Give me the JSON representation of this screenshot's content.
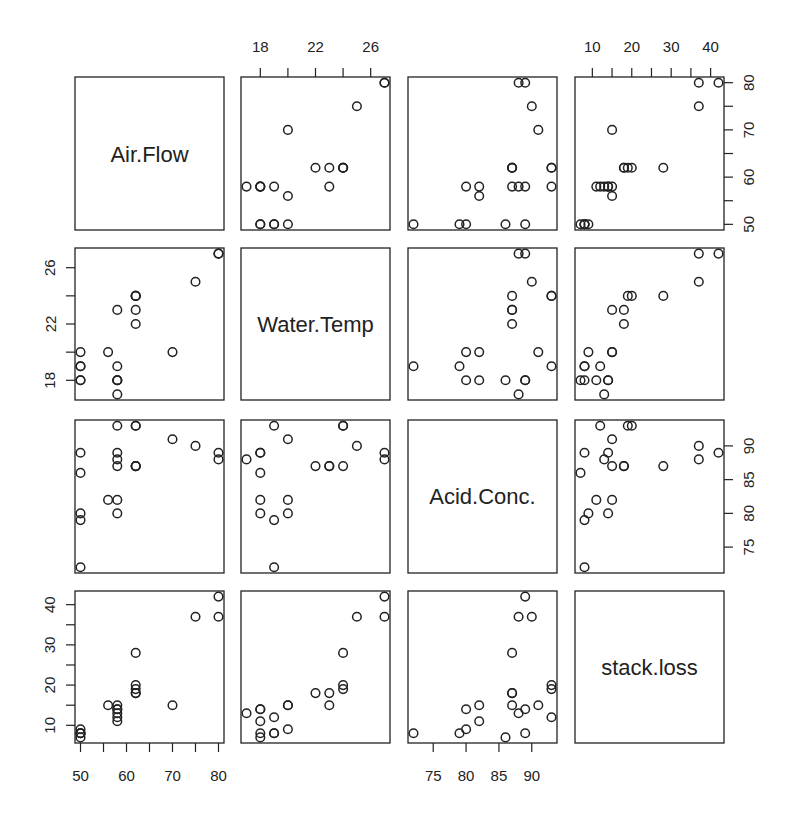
{
  "chart_data": {
    "type": "scatter",
    "subtype": "scatterplot-matrix",
    "title": "",
    "variables": [
      "Air.Flow",
      "Water.Temp",
      "Acid.Conc.",
      "stack.loss"
    ],
    "ranges": {
      "Air.Flow": [
        50,
        80
      ],
      "Water.Temp": [
        17,
        27
      ],
      "Acid.Conc.": [
        72,
        93
      ],
      "stack.loss": [
        7,
        42
      ]
    },
    "ticks": {
      "Air.Flow": {
        "major": [
          50,
          55,
          60,
          65,
          70,
          75,
          80
        ],
        "labels": [
          "50",
          "60",
          "70",
          "80"
        ],
        "label_values": [
          50,
          60,
          70,
          80
        ]
      },
      "Water.Temp": {
        "major": [
          18,
          20,
          22,
          24,
          26
        ],
        "labels": [
          "18",
          "22",
          "26"
        ],
        "label_values": [
          18,
          22,
          26
        ]
      },
      "Acid.Conc.": {
        "major": [
          75,
          80,
          85,
          90
        ],
        "labels": [
          "75",
          "80",
          "85",
          "90"
        ],
        "label_values": [
          75,
          80,
          85,
          90
        ]
      },
      "stack.loss": {
        "major": [
          10,
          15,
          20,
          25,
          30,
          35,
          40
        ],
        "labels": [
          "10",
          "20",
          "30",
          "40"
        ],
        "label_values": [
          10,
          20,
          30,
          40
        ]
      }
    },
    "axis_placement": {
      "top": [
        "Water.Temp",
        "stack.loss"
      ],
      "bottom": [
        "Air.Flow",
        "Acid.Conc."
      ],
      "left": [
        "Water.Temp",
        "stack.loss"
      ],
      "right": [
        "Air.Flow",
        "Acid.Conc."
      ]
    },
    "marker": "open-circle",
    "grid": false,
    "legend": null,
    "data": {
      "Air.Flow": [
        80,
        80,
        75,
        62,
        62,
        62,
        62,
        62,
        58,
        58,
        58,
        58,
        58,
        58,
        50,
        50,
        50,
        50,
        50,
        56,
        70
      ],
      "Water.Temp": [
        27,
        27,
        25,
        24,
        22,
        23,
        24,
        24,
        23,
        18,
        18,
        17,
        18,
        19,
        18,
        18,
        19,
        19,
        20,
        20,
        20
      ],
      "Acid.Conc.": [
        89,
        88,
        90,
        87,
        87,
        87,
        93,
        93,
        87,
        80,
        89,
        88,
        82,
        93,
        89,
        86,
        72,
        79,
        80,
        82,
        91
      ],
      "stack.loss": [
        42,
        37,
        37,
        28,
        18,
        18,
        19,
        20,
        15,
        14,
        14,
        13,
        11,
        12,
        8,
        7,
        8,
        8,
        9,
        15,
        15
      ]
    }
  },
  "panel_labels": {
    "p0": "Air.Flow",
    "p1": "Water.Temp",
    "p2": "Acid.Conc.",
    "p3": "stack.loss"
  },
  "colors": {
    "foreground": "#222222",
    "background": "#ffffff",
    "marker_stroke": "#222222"
  }
}
